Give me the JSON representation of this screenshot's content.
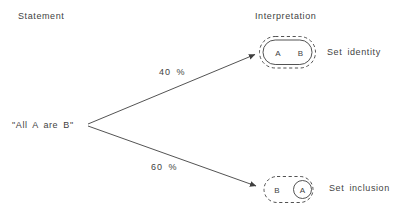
{
  "diagram": {
    "headers": {
      "left": "Statement",
      "right": "Interpretation"
    },
    "statement": "\"All A are B\"",
    "branches": [
      {
        "percent": "40 %",
        "interpretation_label": "Set identity",
        "left_set": "A",
        "right_set": "B"
      },
      {
        "percent": "60 %",
        "interpretation_label": "Set inclusion",
        "left_set": "B",
        "right_set": "A"
      }
    ],
    "colors": {
      "ink": "#3f3f3f",
      "background": "#ffffff"
    }
  }
}
